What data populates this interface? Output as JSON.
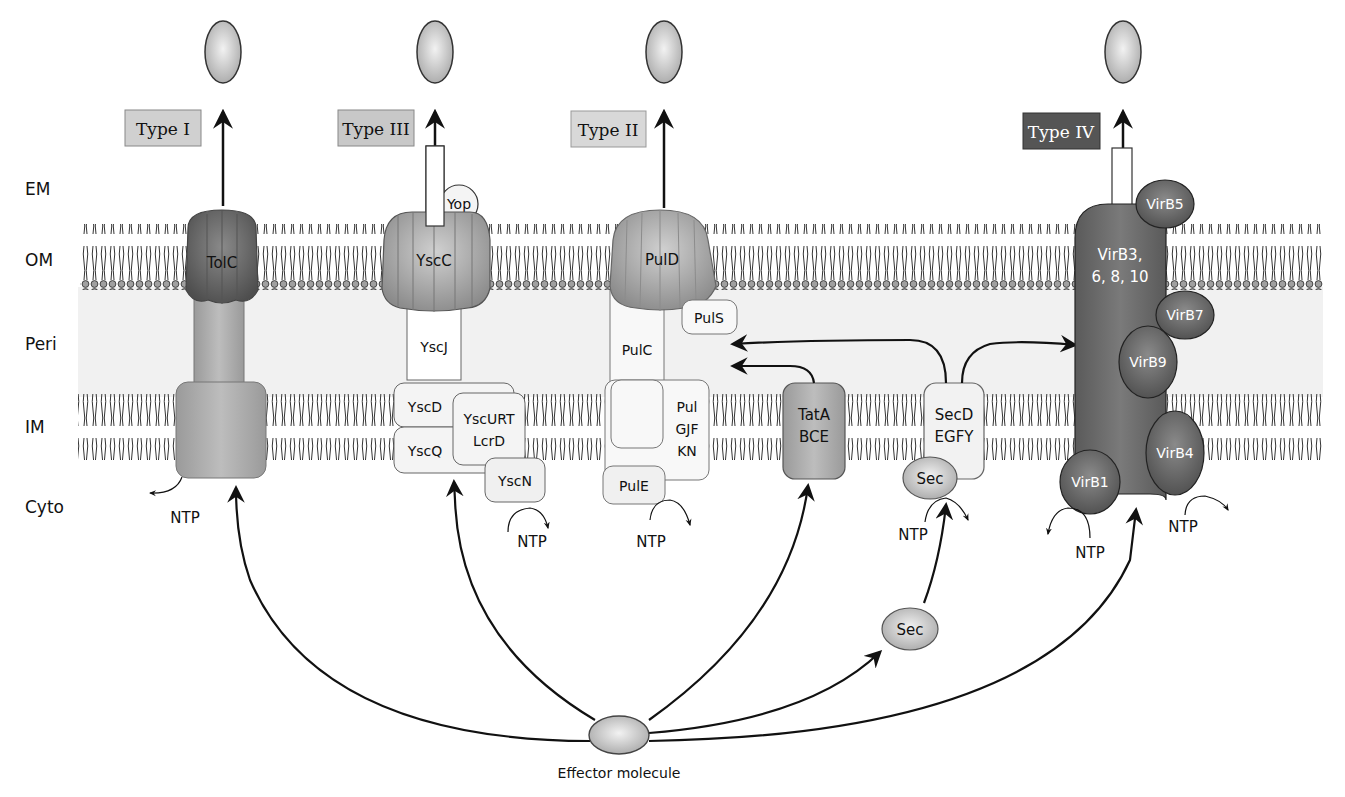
{
  "colors": {
    "membrane_head": "#9a9a9a",
    "membrane_tail": "#333333",
    "periplasm": "#f1f1f1",
    "protein_light": "#e8e8e8",
    "protein_mid": "#b8b8b8",
    "protein_dark": "#7a7a7a",
    "protein_darker": "#5e5e5e",
    "type_label_light": "#d0d0d0",
    "type_label_dark": "#555555"
  },
  "layers": {
    "em": "EM",
    "om": "OM",
    "peri": "Peri",
    "im": "IM",
    "cyto": "Cyto"
  },
  "systems": {
    "type1": {
      "label": "Type I",
      "om_protein": "TolC"
    },
    "type3": {
      "label": "Type III",
      "om_protein": "YscC",
      "tip": "Yop",
      "peri_protein": "YscJ",
      "im_proteins": [
        "YscD",
        "YscQ"
      ],
      "im_protein_urt_line1": "YscURT",
      "im_protein_urt_line2": "LcrD",
      "atpase": "YscN"
    },
    "type2": {
      "label": "Type II",
      "om_protein": "PulD",
      "pilot": "PulS",
      "peri_protein": "PulC",
      "im_line1": "Pul",
      "im_line2": "GJF",
      "im_line3": "KN",
      "atpase": "PulE"
    },
    "tat": {
      "line1": "TatA",
      "line2": "BCE"
    },
    "sec": {
      "line1": "SecD",
      "line2": "EGFY",
      "atpase": "Sec",
      "free": "Sec"
    },
    "type4": {
      "label": "Type IV",
      "core_line1": "VirB3,",
      "core_line2": "6, 8, 10",
      "virb5": "VirB5",
      "virb7": "VirB7",
      "virb9": "VirB9",
      "virb4": "VirB4",
      "virb1": "VirB1"
    }
  },
  "ntp_label": "NTP",
  "effector_label": "Effector molecule"
}
